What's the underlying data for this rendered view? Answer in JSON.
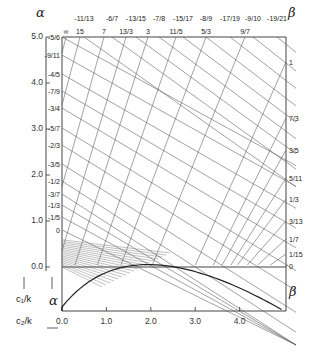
{
  "diagram": {
    "alpha_symbol": "α",
    "beta_symbol": "β",
    "c1_axis_label": "c₁/k",
    "c2_axis_label": "c₂/k",
    "left_axis_ticks": [
      {
        "label": "5.0",
        "value": 5.0
      },
      {
        "label": "4.0",
        "value": 4.0
      },
      {
        "label": "3.0",
        "value": 3.0
      },
      {
        "label": "2.0",
        "value": 2.0
      },
      {
        "label": "1.0",
        "value": 1.0
      },
      {
        "label": "0.0",
        "value": 0.0
      }
    ],
    "bottom_axis_ticks": [
      {
        "label": "0.0",
        "value": 0.0
      },
      {
        "label": "1.0",
        "value": 1.0
      },
      {
        "label": "2.0",
        "value": 2.0
      },
      {
        "label": "3.0",
        "value": 3.0
      },
      {
        "label": "4.0",
        "value": 4.0
      }
    ],
    "alpha_left_labels": [
      "-5/6",
      "-9/11",
      "-4/5",
      "-7/9",
      "-3/4",
      "-5/7",
      "-2/3",
      "-3/5",
      "-1/2",
      "-3/7",
      "-1/3",
      "-1/5",
      "0"
    ],
    "alpha_top_labels": [
      "-11/13",
      "-6/7",
      "-13/15",
      "-7/8",
      "-15/17",
      "-8/9",
      "-17/19",
      "-9/10",
      "-19/21"
    ],
    "beta_top_labels": [
      "∞",
      "15",
      "7",
      "13/3",
      "3",
      "11/5",
      "5/3",
      "9/7"
    ],
    "beta_right_labels": [
      "1",
      "7/3",
      "3/5",
      "5/11",
      "1/3",
      "3/13",
      "1/7",
      "1/15",
      "0"
    ]
  }
}
